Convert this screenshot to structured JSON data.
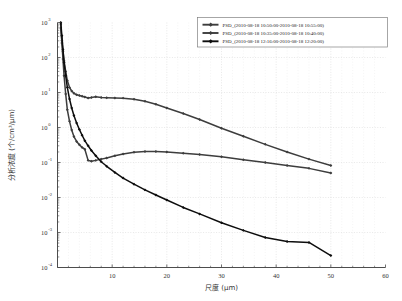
{
  "chart_data": {
    "type": "line",
    "title": "",
    "xlabel": "尺度 (μm)",
    "ylabel": "分析浓度 (个/cm³/μm)",
    "xlim": [
      0,
      60
    ],
    "ylim": [
      0.0001,
      1000
    ],
    "yscale": "log",
    "xscale": "linear",
    "grid": true,
    "legend_position": "top-right",
    "xticks": [
      0,
      10,
      20,
      30,
      40,
      50,
      60
    ],
    "xtick_labels": [
      "",
      "10",
      "20",
      "30",
      "40",
      "50",
      "60"
    ],
    "yticks": [
      0.0001,
      0.001,
      0.01,
      0.1,
      1,
      10,
      100,
      1000
    ],
    "ytick_labels": [
      "10⁻⁴",
      "10⁻³",
      "10⁻²",
      "10⁻¹",
      "10⁰",
      "10¹",
      "10²",
      "10³"
    ],
    "ytick_mantissa": [
      "10",
      "10",
      "10",
      "10",
      "10",
      "10",
      "10",
      "10"
    ],
    "ytick_exponent": [
      "-4",
      "-3",
      "-2",
      "-1",
      "0",
      "1",
      "2",
      "3"
    ],
    "series": [
      {
        "name": "PSD_(2010-08-18  10:50:00-2010-08-18  10:55:00)",
        "color": "#3d3d3d",
        "marker": "diamond",
        "x": [
          0.6,
          0.8,
          1.0,
          1.2,
          1.5,
          1.8,
          2.2,
          2.6,
          3.0,
          3.5,
          4.0,
          4.5,
          5.0,
          5.6,
          6.2,
          7.0,
          8.0,
          9.0,
          10.5,
          12.0,
          14.0,
          16.0,
          18.0,
          20.0,
          23.0,
          26.0,
          30.0,
          34.0,
          38.0,
          42.0,
          46.0,
          50.0
        ],
        "y": [
          700.0,
          300.0,
          150.0,
          80.0,
          40.0,
          22.0,
          14.0,
          11.0,
          9.5,
          8.6,
          8.2,
          7.8,
          7.4,
          7.0,
          7.2,
          7.6,
          7.2,
          7.1,
          7.0,
          6.9,
          6.4,
          5.6,
          4.6,
          3.6,
          2.5,
          1.7,
          0.95,
          0.56,
          0.33,
          0.2,
          0.125,
          0.082
        ]
      },
      {
        "name": "PSD_(2010-08-18  10:35:00-2010-08-18  10:40:00)",
        "color": "#3d3d3d",
        "marker": "diamond",
        "x": [
          0.6,
          0.8,
          1.0,
          1.2,
          1.5,
          1.8,
          2.2,
          2.6,
          3.0,
          3.5,
          4.0,
          4.5,
          5.0,
          5.6,
          6.2,
          7.0,
          8.0,
          9.0,
          10.5,
          12.0,
          14.0,
          16.0,
          18.0,
          20.0,
          23.0,
          26.0,
          30.0,
          34.0,
          38.0,
          42.0,
          46.0,
          50.0
        ],
        "y": [
          900.0,
          260.0,
          90.0,
          30.0,
          9.0,
          3.2,
          1.5,
          0.85,
          0.55,
          0.4,
          0.32,
          0.27,
          0.24,
          0.115,
          0.108,
          0.115,
          0.125,
          0.135,
          0.155,
          0.175,
          0.195,
          0.205,
          0.205,
          0.2,
          0.185,
          0.17,
          0.145,
          0.12,
          0.1,
          0.082,
          0.068,
          0.05
        ]
      },
      {
        "name": "PSD_(2010-08-18  12:16:00-2010-08-18  12:20:00)",
        "color": "#0d0d0d",
        "marker": "diamond",
        "x": [
          0.6,
          0.8,
          1.0,
          1.2,
          1.5,
          1.8,
          2.2,
          2.6,
          3.0,
          3.5,
          4.0,
          4.5,
          5.0,
          5.6,
          6.2,
          7.0,
          8.0,
          9.0,
          10.5,
          12.0,
          14.0,
          16.0,
          18.0,
          20.0,
          23.0,
          26.0,
          30.0,
          34.0,
          38.0,
          42.0,
          46.0,
          50.0
        ],
        "y": [
          1000.0,
          420.0,
          170.0,
          72.0,
          30.0,
          14.0,
          6.5,
          3.6,
          2.2,
          1.35,
          0.88,
          0.6,
          0.42,
          0.3,
          0.22,
          0.155,
          0.105,
          0.078,
          0.052,
          0.036,
          0.024,
          0.0165,
          0.0118,
          0.0085,
          0.0052,
          0.0034,
          0.0019,
          0.00115,
          0.00072,
          0.00055,
          0.00052,
          0.00022
        ]
      }
    ]
  },
  "legend": {
    "entries": [
      "PSD_(2010-08-18  10:50:00-2010-08-18  10:55:00)",
      "PSD_(2010-08-18  10:35:00-2010-08-18  10:40:00)",
      "PSD_(2010-08-18  12:16:00-2010-08-18  12:20:00)"
    ]
  }
}
